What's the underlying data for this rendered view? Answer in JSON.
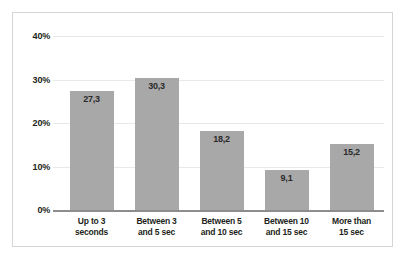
{
  "chart_data": {
    "type": "bar",
    "title": "",
    "subtitle": "",
    "xlabel": "",
    "ylabel": "",
    "categories": [
      "Up to 3\nseconds",
      "Between 3\nand 5 sec",
      "Between 5\nand 10 sec",
      "Between 10\nand 15 sec",
      "More than\n15 sec"
    ],
    "values": [
      27.3,
      30.3,
      18.2,
      9.1,
      15.2
    ],
    "value_labels": [
      "27,3",
      "30,3",
      "18,2",
      "9,1",
      "15,2"
    ],
    "ylim": [
      0,
      40
    ],
    "yticks": [
      0,
      10,
      20,
      30,
      40
    ],
    "ytick_labels": [
      "0%",
      "10%",
      "20%",
      "30%",
      "40%"
    ],
    "grid": true,
    "legend": "none",
    "bar_color": "#a8a8a8",
    "gridline_color": "#e9e9e9",
    "axis_color": "#8d8d8d",
    "border_color": "#d5d5d5",
    "background_color": "#ffffff"
  }
}
